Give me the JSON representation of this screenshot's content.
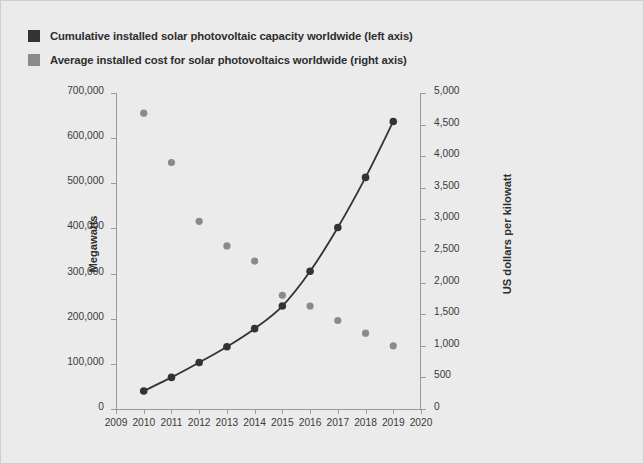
{
  "legend": {
    "items": [
      {
        "label": "Cumulative installed solar photovoltaic capacity worldwide (left axis)",
        "color": "#333333",
        "swatch_name": "legend-swatch-capacity"
      },
      {
        "label": "Average installed cost for solar photovoltaics worldwide (right axis)",
        "color": "#8a8a8a",
        "swatch_name": "legend-swatch-cost"
      }
    ]
  },
  "chart_data": {
    "type": "line",
    "title": "",
    "xlabel": "",
    "ylabel": "Megawatts",
    "y2label": "US dollars per kilowatt",
    "x": [
      2010,
      2011,
      2012,
      2013,
      2014,
      2015,
      2016,
      2017,
      2018,
      2019
    ],
    "xlim": [
      2009,
      2020
    ],
    "xticks": [
      "2009",
      "2010",
      "2011",
      "2012",
      "2013",
      "2014",
      "2015",
      "2016",
      "2017",
      "2018",
      "2019",
      "2020"
    ],
    "ylim": [
      0,
      700000
    ],
    "yticks": [
      "0",
      "100,000",
      "200,000",
      "300,000",
      "400,000",
      "500,000",
      "600,000",
      "700,000"
    ],
    "ytick_values": [
      0,
      100000,
      200000,
      300000,
      400000,
      500000,
      600000,
      700000
    ],
    "y2lim": [
      0,
      5000
    ],
    "y2ticks": [
      "0",
      "500",
      "1,000",
      "1,500",
      "2,000",
      "2,500",
      "3,000",
      "3,500",
      "4,000",
      "4,500",
      "5,000"
    ],
    "y2tick_values": [
      0,
      500,
      1000,
      1500,
      2000,
      2500,
      3000,
      3500,
      4000,
      4500,
      5000
    ],
    "grid": false,
    "legend_position": "above-plot",
    "series": [
      {
        "name": "Cumulative installed solar photovoltaic capacity worldwide (left axis)",
        "axis": "left",
        "unit": "Megawatts",
        "type": "line+markers",
        "color": "#333333",
        "values": [
          40000,
          70000,
          103000,
          138000,
          178000,
          228000,
          305000,
          402000,
          513000,
          637000
        ]
      },
      {
        "name": "Average installed cost for solar photovoltaics worldwide (right axis)",
        "axis": "right",
        "unit": "US dollars per kilowatt",
        "type": "scatter",
        "color": "#8a8a8a",
        "values": [
          4680,
          3900,
          2970,
          2580,
          2340,
          1800,
          1630,
          1400,
          1200,
          1000
        ]
      }
    ]
  }
}
